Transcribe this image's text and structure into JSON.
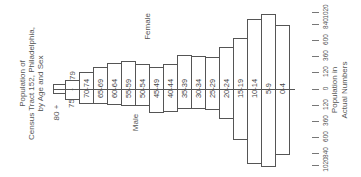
{
  "chart_data": {
    "type": "bar",
    "orientation": "population-pyramid (rotated 90° counter-clockwise)",
    "title": "Population of Census Tract 152, Philadelphia, by Age and Sex",
    "title_lines": [
      "Population of",
      "Census Tract 152, Philadelphia,",
      "by Age and Sex"
    ],
    "xlabel": "Population in Actual Numbers",
    "xlabel_lines": [
      "Population in",
      "Actual Numbers"
    ],
    "tick_labels": [
      "1020",
      "840",
      "600",
      "360",
      "120",
      "0",
      "120",
      "360",
      "600",
      "840",
      "1020"
    ],
    "axis_range": [
      -1020,
      1020
    ],
    "grid": false,
    "legend": [
      "Male",
      "Female"
    ],
    "categories": [
      "80 +",
      "75 - 79",
      "70-74",
      "65-69",
      "60-64",
      "55-59",
      "50-54",
      "45-49",
      "40-44",
      "35-39",
      "30-34",
      "25-29",
      "20-24",
      "15-19",
      "10-14",
      "5-9",
      "0-4"
    ],
    "series": [
      {
        "name": "Female",
        "values": [
          70,
          120,
          230,
          290,
          340,
          370,
          330,
          290,
          330,
          450,
          440,
          430,
          560,
          670,
          930,
          990,
          850
        ]
      },
      {
        "name": "Male",
        "values": [
          70,
          150,
          200,
          200,
          210,
          230,
          230,
          320,
          310,
          270,
          260,
          280,
          400,
          680,
          990,
          1030,
          870
        ]
      }
    ]
  },
  "labels": {
    "male": "Male",
    "female": "Female",
    "age_80": "80 +",
    "age_75_a": "75",
    "age_75_b": "-",
    "age_75_c": "79"
  }
}
